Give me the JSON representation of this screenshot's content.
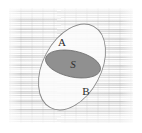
{
  "figure": {
    "name": "set-venn-diagram",
    "caption_visible": false,
    "background": {
      "style": "scanned-paper-horizontal-streak-texture",
      "base_color": "#ededed",
      "plate_rect": {
        "x": 9,
        "y": 8,
        "width": 124,
        "height": 115
      }
    },
    "outer_set": {
      "label": "",
      "shape": "ellipse",
      "rotation_deg": 28,
      "center": {
        "x": 72,
        "y": 67
      },
      "radius_x": 29,
      "radius_y": 46,
      "fill_color": "#fbfbfb",
      "stroke_color": "#8a8a8a"
    },
    "inner_subset": {
      "label": "S",
      "shape": "ellipse",
      "rotation_deg": 12,
      "center": {
        "x": 73,
        "y": 64
      },
      "radius_x": 28,
      "radius_y": 13,
      "fill_color": "#909090",
      "stroke_color": "#6f6f6f"
    },
    "regions": [
      {
        "key": "upper",
        "label": "A",
        "x": 62,
        "y": 46
      },
      {
        "key": "lower",
        "label": "B",
        "x": 86,
        "y": 95
      }
    ]
  }
}
